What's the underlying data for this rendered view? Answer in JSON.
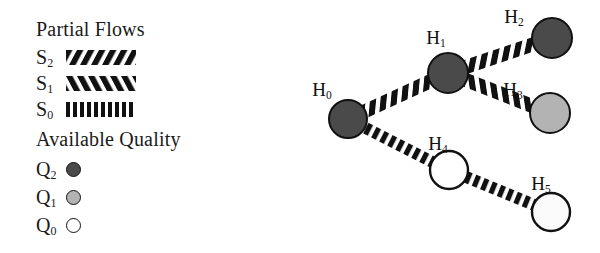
{
  "legend": {
    "flows": {
      "title": "Partial Flows",
      "items": [
        {
          "label": "S",
          "sub": "2",
          "pattern": "diagonal-backslash-hatch",
          "name": "s2"
        },
        {
          "label": "S",
          "sub": "1",
          "pattern": "diagonal-forwardslash-hatch",
          "name": "s1"
        },
        {
          "label": "S",
          "sub": "0",
          "pattern": "vertical-bar-hatch",
          "name": "s0"
        }
      ]
    },
    "quality": {
      "title": "Available Quality",
      "items": [
        {
          "label": "Q",
          "sub": "2",
          "fill": "#4a4a4a",
          "name": "q2"
        },
        {
          "label": "Q",
          "sub": "1",
          "fill": "#b3b3b3",
          "name": "q1"
        },
        {
          "label": "Q",
          "sub": "0",
          "fill": "#ffffff",
          "name": "q0"
        }
      ]
    }
  },
  "graph": {
    "nodes": [
      {
        "id": "H0",
        "label": "H",
        "sub": "0",
        "cx": 88,
        "cy": 119,
        "r": 19,
        "quality": "Q2",
        "fill": "#4a4a4a",
        "label_x": 62,
        "label_y": 90
      },
      {
        "id": "H1",
        "label": "H",
        "sub": "1",
        "cx": 188,
        "cy": 73,
        "r": 20,
        "quality": "Q2",
        "fill": "#4a4a4a",
        "label_x": 176,
        "label_y": 38
      },
      {
        "id": "H2",
        "label": "H",
        "sub": "2",
        "cx": 292,
        "cy": 38,
        "r": 20,
        "quality": "Q2",
        "fill": "#4a4a4a",
        "label_x": 254,
        "label_y": 17
      },
      {
        "id": "H3",
        "label": "H",
        "sub": "3",
        "cx": 290,
        "cy": 113,
        "r": 20,
        "quality": "Q1",
        "fill": "#b3b3b3",
        "label_x": 253,
        "label_y": 90
      },
      {
        "id": "H4",
        "label": "H",
        "sub": "4",
        "cx": 189,
        "cy": 170,
        "r": 19,
        "quality": "Q0",
        "fill": "#ffffff",
        "label_x": 178,
        "label_y": 144
      },
      {
        "id": "H5",
        "label": "H",
        "sub": "5",
        "cx": 291,
        "cy": 212,
        "r": 19,
        "quality": "Q0",
        "fill": "#fbfbfb",
        "label_x": 281,
        "label_y": 184
      }
    ],
    "edges": [
      {
        "from": "H0",
        "to": "H1",
        "flow": "S2",
        "pattern": "diagonal-backslash-hatch"
      },
      {
        "from": "H1",
        "to": "H2",
        "flow": "S2",
        "pattern": "diagonal-backslash-hatch"
      },
      {
        "from": "H1",
        "to": "H3",
        "flow": "S1",
        "pattern": "diagonal-forwardslash-hatch"
      },
      {
        "from": "H0",
        "to": "H4",
        "flow": "S0",
        "pattern": "vertical-bar-hatch"
      },
      {
        "from": "H4",
        "to": "H5",
        "flow": "S0",
        "pattern": "vertical-bar-hatch"
      }
    ]
  },
  "colors": {
    "ink": "#111111",
    "q2": "#4a4a4a",
    "q1": "#b3b3b3",
    "q0": "#ffffff"
  }
}
